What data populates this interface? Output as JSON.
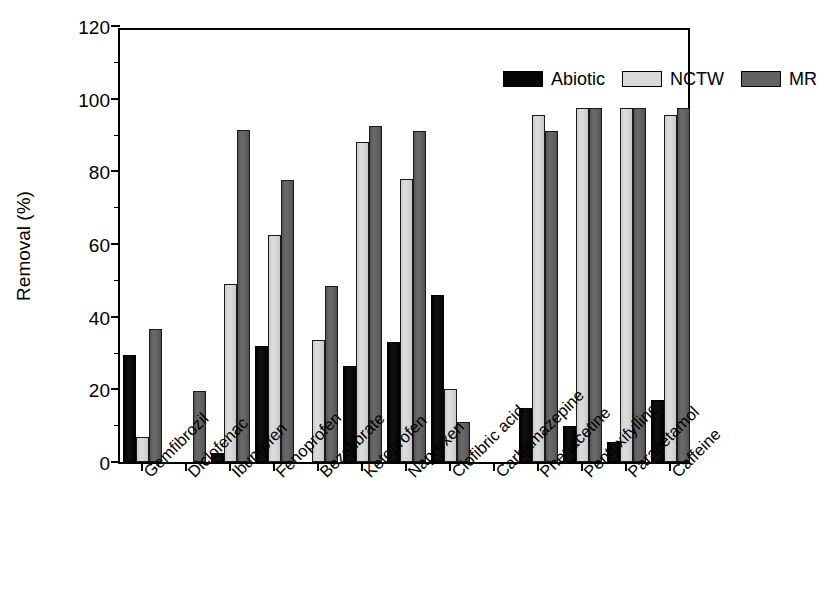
{
  "figure": {
    "background": "#ffffff",
    "frame_color": "#000000"
  },
  "chart_data": {
    "type": "bar",
    "title": "",
    "xlabel": "",
    "ylabel": "Removal (%)",
    "ylim": [
      0,
      120
    ],
    "ytick_labels": [
      "0",
      "20",
      "40",
      "60",
      "80",
      "100",
      "120"
    ],
    "ytick_values": [
      0,
      20,
      40,
      60,
      80,
      100,
      120
    ],
    "yminor_values": [
      10,
      30,
      50,
      70,
      90,
      110
    ],
    "grid": false,
    "legend_position": "top-right inside",
    "categories": [
      "Gemfibrozil",
      "Diclofenac",
      "Ibuprofen",
      "Fenoprofen",
      "Bezafibrate",
      "Ketoprofen",
      "Naproxen",
      "Clofibric acid",
      "Carbamazepine",
      "Phenacetine",
      "Pentoxifylline",
      "Paracetamol",
      "Caffeine"
    ],
    "series": [
      {
        "name": "Abiotic",
        "color": "#050505",
        "values": [
          29.5,
          0,
          2.5,
          32,
          0,
          26.5,
          33,
          46,
          0,
          15,
          10,
          5.5,
          17
        ]
      },
      {
        "name": "NCTW",
        "color": "#d9d9d9",
        "values": [
          7,
          0,
          49,
          62.5,
          33.5,
          88,
          78,
          20,
          0,
          95.5,
          97.5,
          97.5,
          95.5
        ]
      },
      {
        "name": "MR",
        "color": "#626262",
        "values": [
          36.5,
          19.5,
          91.5,
          77.5,
          48.5,
          92.5,
          91,
          11,
          0,
          91,
          97.5,
          97.5,
          97.5
        ]
      }
    ]
  },
  "caption_fragment": ""
}
